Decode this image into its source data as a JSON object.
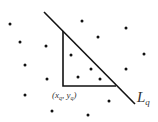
{
  "diagram": {
    "line_label": "L",
    "line_label_sub": "q",
    "point_label": {
      "open": "(",
      "x": "x",
      "x_sub": "q",
      "comma": ", ",
      "y": "y",
      "y_sub": "q",
      "close": ")"
    },
    "colors": {
      "stroke": "#111111",
      "dot": "#111111",
      "text": "#333333"
    },
    "line": {
      "x1": 44,
      "y1": 12,
      "x2": 135,
      "y2": 104
    },
    "triangle": {
      "corner": [
        63,
        86
      ],
      "top": [
        63,
        31
      ],
      "right": [
        116,
        86
      ]
    },
    "dots": [
      [
        10,
        24
      ],
      [
        82,
        21
      ],
      [
        126,
        28
      ],
      [
        20,
        42
      ],
      [
        98,
        37
      ],
      [
        46,
        46
      ],
      [
        71,
        55
      ],
      [
        144,
        54
      ],
      [
        25,
        65
      ],
      [
        91,
        69
      ],
      [
        126,
        69
      ],
      [
        78,
        77
      ],
      [
        47,
        79
      ],
      [
        100,
        79
      ],
      [
        25,
        95
      ],
      [
        109,
        101
      ],
      [
        52,
        111
      ],
      [
        88,
        115
      ]
    ]
  }
}
